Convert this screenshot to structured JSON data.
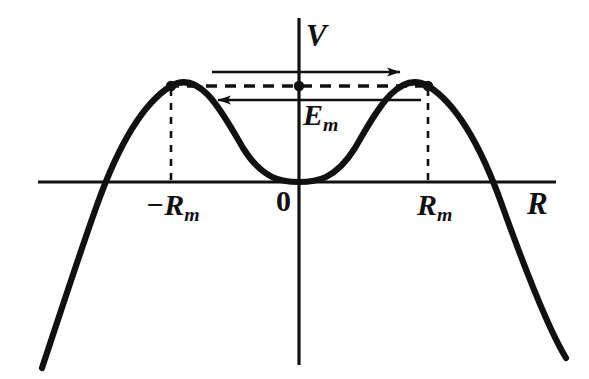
{
  "figure": {
    "kind": "potential-energy-curve",
    "background_color": "#ffffff",
    "stroke_color": "#111111"
  },
  "axes": {
    "vertical": {
      "name": "V",
      "label": "V",
      "x": 299,
      "y_top": 18,
      "y_bottom": 365
    },
    "horizontal": {
      "name": "R",
      "label": "R",
      "y": 182,
      "x_left": 38,
      "x_right": 556
    },
    "origin_label": "0"
  },
  "ticks": [
    {
      "label_html": "−R<span class=\"sub\">m</span>",
      "label_text": "-Rm",
      "x": 171
    },
    {
      "label_html": "R<span class=\"sub\">m</span>",
      "label_text": "Rm",
      "x": 428
    }
  ],
  "energy_level": {
    "label_html": "E<span class=\"sub\">m</span>",
    "label_text": "Em",
    "y": 86,
    "x_start": 171,
    "x_end": 428,
    "style": "dashed"
  },
  "markers": [
    {
      "name": "left-barrier-maximum",
      "x": 171,
      "y": 86
    },
    {
      "name": "center-energy-point",
      "x": 299,
      "y": 86
    },
    {
      "name": "right-barrier-maximum",
      "x": 428,
      "y": 86
    }
  ],
  "drop_lines": [
    {
      "name": "left-drop-line",
      "x": 171,
      "y_top": 88,
      "y_bottom": 182
    },
    {
      "name": "right-drop-line",
      "x": 428,
      "y_top": 88,
      "y_bottom": 182
    }
  ],
  "flow_arrows": [
    {
      "name": "outward-arrow-right",
      "direction": "right",
      "y": 72,
      "x_start": 212,
      "x_end": 403
    },
    {
      "name": "inward-arrow-left",
      "direction": "left",
      "y": 100,
      "x_start": 421,
      "x_end": 215
    }
  ],
  "chart_data": {
    "type": "line",
    "title": "",
    "xlabel": "R",
    "ylabel": "V",
    "grid": false,
    "legend": null,
    "curve_name": "V(R)",
    "maxima": [
      {
        "x_label": "-Rm",
        "x_px": 171,
        "y_px": 86
      },
      {
        "x_label": "Rm",
        "x_px": 428,
        "y_px": 86
      }
    ],
    "minimum": {
      "x_label": "0",
      "x_px": 299,
      "y_px": 182
    },
    "zero_crossings_px": [
      97,
      530
    ],
    "x_range_px": [
      42,
      566
    ],
    "points_px": [
      [
        42,
        368
      ],
      [
        52,
        341
      ],
      [
        62,
        315
      ],
      [
        72,
        290
      ],
      [
        82,
        265
      ],
      [
        92,
        240
      ],
      [
        97,
        182
      ],
      [
        104,
        196
      ],
      [
        114,
        173
      ],
      [
        124,
        151
      ],
      [
        134,
        131
      ],
      [
        144,
        114
      ],
      [
        154,
        101
      ],
      [
        163,
        92
      ],
      [
        171,
        86
      ],
      [
        181,
        88
      ],
      [
        191,
        96
      ],
      [
        201,
        108
      ],
      [
        211,
        123
      ],
      [
        221,
        138
      ],
      [
        234,
        155
      ],
      [
        247,
        168
      ],
      [
        260,
        176
      ],
      [
        274,
        180
      ],
      [
        287,
        182
      ],
      [
        299,
        182
      ],
      [
        311,
        182
      ],
      [
        325,
        180
      ],
      [
        338,
        176
      ],
      [
        351,
        168
      ],
      [
        364,
        155
      ],
      [
        377,
        138
      ],
      [
        387,
        123
      ],
      [
        397,
        108
      ],
      [
        407,
        96
      ],
      [
        417,
        88
      ],
      [
        428,
        86
      ],
      [
        437,
        90
      ],
      [
        447,
        100
      ],
      [
        457,
        115
      ],
      [
        467,
        134
      ],
      [
        477,
        156
      ],
      [
        487,
        176
      ],
      [
        497,
        196
      ],
      [
        507,
        215
      ],
      [
        517,
        236
      ],
      [
        530,
        182
      ],
      [
        538,
        278
      ],
      [
        548,
        304
      ],
      [
        558,
        332
      ],
      [
        566,
        358
      ]
    ]
  }
}
